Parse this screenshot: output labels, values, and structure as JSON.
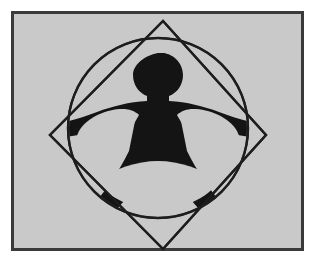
{
  "image": {
    "title": "Vitruvian figure inscribed in circle and diamond",
    "caption": "Black human silhouette with arms outstretched and legs apart, inscribed inside a circle which is inscribed inside a rotated square (diamond), all on a light gray framed panel.",
    "canvas": {
      "width": 322,
      "height": 270
    }
  },
  "colors": {
    "page_background": "#ffffff",
    "panel_background": "#c9c9c9",
    "panel_border": "#3a3a3a",
    "ink": "#141414",
    "stroke": "#1d1d1d"
  },
  "panel": {
    "label": "figure panel",
    "x": 11,
    "y": 11,
    "width": 293,
    "height": 240,
    "border_width": 3
  },
  "geometry": {
    "diamond": {
      "label": "rotated square",
      "top": [
        152,
        10
      ],
      "right": [
        255,
        124
      ],
      "bottom": [
        152,
        238
      ],
      "left": [
        39,
        124
      ],
      "stroke_width": 2.4,
      "fill": "none"
    },
    "circle": {
      "label": "inscribed circle",
      "cx": 147,
      "cy": 117,
      "r": 90,
      "stroke_width": 2.4,
      "fill": "none"
    },
    "head": {
      "label": "head",
      "cx": 150,
      "cy": 64,
      "rx": 21,
      "ry": 22
    },
    "body": {
      "label": "torso arms and legs silhouette"
    },
    "void_left": {
      "label": "left armpit void"
    },
    "void_right": {
      "label": "right armpit void"
    },
    "void_bottom": {
      "label": "crotch lens void"
    }
  }
}
